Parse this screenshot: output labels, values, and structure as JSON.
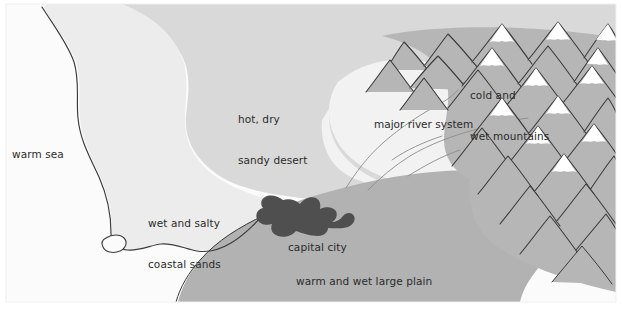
{
  "map": {
    "title": "climate and terrain map",
    "canvas": {
      "width": 622,
      "height": 323
    },
    "frame": {
      "x": 6,
      "y": 4,
      "width": 610,
      "height": 298,
      "fill": "#fbfbfb"
    },
    "palette": {
      "sea": "#fbfbfb",
      "coastal_sands": "#ececec",
      "desert": "#d9d9d9",
      "plain": "#b2b2b2",
      "mountains": "#b6b6b6",
      "river_valley": "#f2f2f2",
      "capital_city": "#4f4f4f",
      "ink": "#3a3a3a",
      "snow": "#ffffff",
      "text": "#2b2b2b"
    },
    "labels": [
      {
        "name": "warm-sea",
        "text": "warm sea",
        "x": 12,
        "y": 148,
        "lines": [
          "warm sea"
        ]
      },
      {
        "name": "hot-dry-sandy-desert",
        "text": "hot, dry sandy desert",
        "x": 238,
        "y": 86,
        "lines": [
          "hot, dry",
          "sandy desert"
        ]
      },
      {
        "name": "wet-and-salty-coastal-sands",
        "text": "wet and salty coastal sands",
        "x": 148,
        "y": 190,
        "lines": [
          "wet and salty",
          "coastal sands"
        ]
      },
      {
        "name": "cold-and-wet-mountains",
        "text": "cold and wet mountains",
        "x": 470,
        "y": 62,
        "lines": [
          "cold and",
          "wet mountains"
        ]
      },
      {
        "name": "major-river-system",
        "text": "major river system",
        "x": 374,
        "y": 118,
        "lines": [
          "major river system"
        ]
      },
      {
        "name": "capital-city",
        "text": "capital city",
        "x": 288,
        "y": 241,
        "lines": [
          "capital city"
        ]
      },
      {
        "name": "warm-and-wet-large-plain",
        "text": "warm and wet large plain",
        "x": 296,
        "y": 275,
        "lines": [
          "warm and wet large plain"
        ]
      }
    ],
    "regions": [
      {
        "name": "warm-sea",
        "label": "warm sea",
        "fill": "#fbfbfb"
      },
      {
        "name": "wet-and-salty-coastal-sands",
        "label": "wet and salty coastal sands",
        "fill": "#ececec"
      },
      {
        "name": "hot-dry-sandy-desert",
        "label": "hot, dry sandy desert",
        "fill": "#d9d9d9"
      },
      {
        "name": "warm-and-wet-large-plain",
        "label": "warm and wet large plain",
        "fill": "#b2b2b2"
      },
      {
        "name": "cold-and-wet-mountains",
        "label": "cold and wet mountains",
        "fill": "#b6b6b6"
      },
      {
        "name": "major-river-system",
        "label": "major river system",
        "fill": "#f2f2f2"
      },
      {
        "name": "capital-city",
        "label": "capital city",
        "fill": "#4f4f4f"
      }
    ]
  }
}
